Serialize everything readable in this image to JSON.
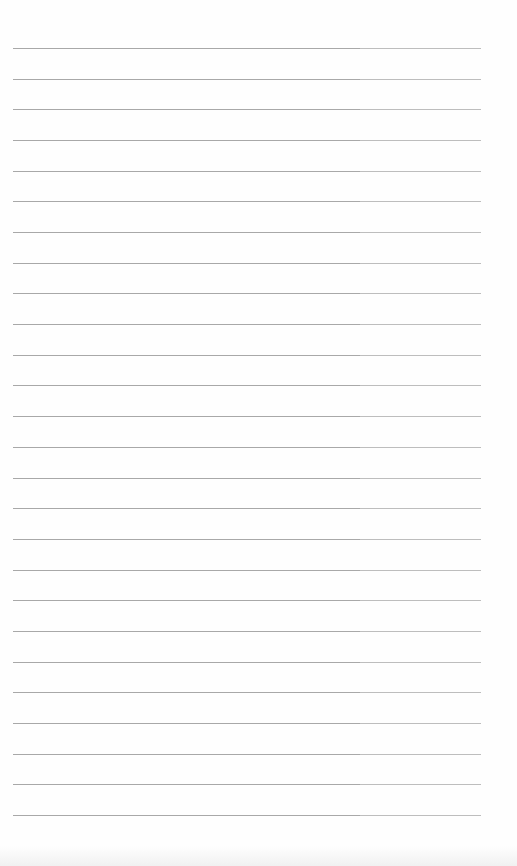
{
  "document": {
    "type": "blank lined paper",
    "line_count": 26,
    "first_line_y": 48,
    "line_spacing": 30.68,
    "line_start_x": 13,
    "line_break_x": 360,
    "line_end_x": 481,
    "colors": {
      "paper": "#fefefe",
      "line_left": "#a8a8a8",
      "line_right": "#bdbdbd"
    },
    "text": ""
  }
}
